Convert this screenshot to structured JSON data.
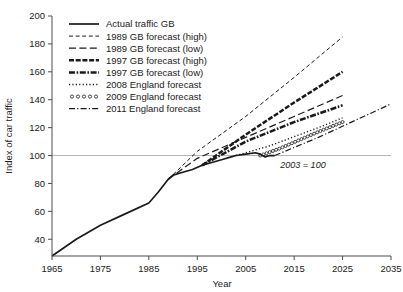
{
  "chart_data": {
    "type": "line",
    "title": "",
    "xlabel": "Year",
    "ylabel": "Index of car traffic",
    "annotation": "2003 = 100",
    "xlim": [
      1965,
      2035
    ],
    "ylim": [
      28,
      200
    ],
    "grid": "single horizontal gridline at y=100",
    "legend_position": "top-left inside plot",
    "xticks": [
      1965,
      1975,
      1985,
      1995,
      2005,
      2015,
      2025,
      2035
    ],
    "yticks": [
      40,
      60,
      80,
      100,
      120,
      140,
      160,
      180,
      200
    ],
    "series": [
      {
        "name": "Actual traffic GB",
        "style": "solid",
        "x": [
          1965,
          1970,
          1975,
          1980,
          1985,
          1987,
          1989,
          1990,
          1992,
          1994,
          1996,
          1998,
          2000,
          2002,
          2003,
          2005,
          2007,
          2008,
          2009,
          2010,
          2011
        ],
        "values": [
          28,
          40,
          50,
          58,
          66,
          74,
          83,
          86,
          88,
          90,
          93,
          95,
          97,
          99,
          100,
          101,
          102,
          101,
          99,
          100,
          100
        ]
      },
      {
        "name": "1989 GB forecast (high)",
        "style": "dashed-fine",
        "x": [
          1989,
          1995,
          2005,
          2015,
          2025
        ],
        "values": [
          83,
          103,
          128,
          156,
          185
        ]
      },
      {
        "name": "1989 GB forecast (low)",
        "style": "dashed-long",
        "x": [
          1989,
          1995,
          2005,
          2015,
          2025
        ],
        "values": [
          83,
          98,
          113,
          128,
          143
        ]
      },
      {
        "name": "1997 GB forecast (high)",
        "style": "dash-dot-heavy",
        "x": [
          1996,
          2005,
          2015,
          2025
        ],
        "values": [
          93,
          115,
          138,
          160
        ]
      },
      {
        "name": "1997 GB forecast (low)",
        "style": "dash-dot-dot-heavy",
        "x": [
          1996,
          2005,
          2015,
          2025
        ],
        "values": [
          93,
          110,
          124,
          136
        ]
      },
      {
        "name": "2008 England forecast",
        "style": "dotted",
        "x": [
          2003,
          2010,
          2020,
          2025
        ],
        "values": [
          100,
          107,
          120,
          127
        ]
      },
      {
        "name": "2009 England forecast",
        "style": "circles",
        "x": [
          2008,
          2012,
          2016,
          2020,
          2025
        ],
        "values": [
          100,
          105,
          111,
          117,
          124
        ]
      },
      {
        "name": "2011 England forecast",
        "style": "dash-dot",
        "x": [
          2011,
          2020,
          2030,
          2035
        ],
        "values": [
          100,
          113,
          129,
          137
        ]
      }
    ]
  },
  "legend": {
    "items": [
      {
        "label": "Actual traffic GB",
        "marker": "solid-line-swatch"
      },
      {
        "label": "1989 GB forecast (high)",
        "marker": "dashed-fine-swatch"
      },
      {
        "label": "1989 GB forecast (low)",
        "marker": "dashed-long-swatch"
      },
      {
        "label": "1997 GB forecast (high)",
        "marker": "dash-dot-heavy-swatch"
      },
      {
        "label": "1997 GB forecast (low)",
        "marker": "dash-dot-dot-heavy-swatch"
      },
      {
        "label": "2008 England forecast",
        "marker": "dotted-swatch"
      },
      {
        "label": "2009 England forecast",
        "marker": "circles-swatch"
      },
      {
        "label": "2011 England forecast",
        "marker": "dash-dot-swatch"
      }
    ]
  },
  "colors": {
    "ink": "#1a1a1a",
    "axis": "#4d4d4d",
    "gridline": "#b3b3b3",
    "background": "#ffffff"
  }
}
